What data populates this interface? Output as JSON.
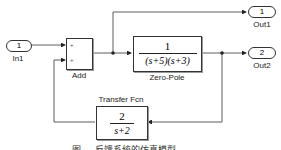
{
  "blocks": {
    "in1": {
      "port_number": "1",
      "label": "In1"
    },
    "add": {
      "label": "Add",
      "input_signs": [
        "+",
        "+"
      ]
    },
    "zero_pole": {
      "label": "Zero-Pole",
      "numerator": "1",
      "denominator": "(s+5)(s+3)"
    },
    "transfer_fcn": {
      "label": "Transfer Fcn",
      "numerator": "2",
      "denominator": "s+2"
    },
    "out1": {
      "port_number": "1",
      "label": "Out1"
    },
    "out2": {
      "port_number": "2",
      "label": "Out2"
    }
  },
  "caption": "图 … 反馈系统的仿真模型",
  "colors": {
    "line": "#333333",
    "background": "#ffffff"
  }
}
